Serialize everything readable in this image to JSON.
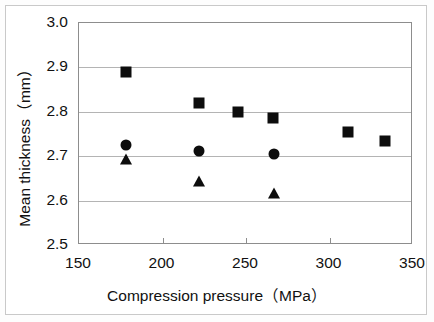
{
  "chart_data": {
    "type": "scatter",
    "title": "",
    "xlabel": "Compression pressure（MPa）",
    "ylabel": "Mean thickness（mm）",
    "xlim": [
      150,
      350
    ],
    "ylim": [
      2.5,
      3.0
    ],
    "xticks": [
      150,
      200,
      250,
      300,
      350
    ],
    "yticks": [
      2.5,
      2.6,
      2.7,
      2.8,
      2.9,
      3.0
    ],
    "xtick_labels": [
      "150",
      "200",
      "250",
      "300",
      "350"
    ],
    "ytick_labels": [
      "2.5",
      "2.6",
      "2.7",
      "2.8",
      "2.9",
      "3.0"
    ],
    "grid": "horizontal",
    "legend": "none",
    "series": [
      {
        "name": "square-series",
        "marker": "square",
        "color": "#0d0d0d",
        "points": [
          {
            "x": 178,
            "y": 2.89
          },
          {
            "x": 222,
            "y": 2.82
          },
          {
            "x": 245,
            "y": 2.8
          },
          {
            "x": 266,
            "y": 2.785
          },
          {
            "x": 311,
            "y": 2.755
          },
          {
            "x": 333,
            "y": 2.735
          }
        ]
      },
      {
        "name": "circle-series",
        "marker": "circle",
        "color": "#0d0d0d",
        "points": [
          {
            "x": 178,
            "y": 2.725
          },
          {
            "x": 222,
            "y": 2.712
          },
          {
            "x": 267,
            "y": 2.705
          }
        ]
      },
      {
        "name": "triangle-series",
        "marker": "triangle",
        "color": "#0d0d0d",
        "points": [
          {
            "x": 178,
            "y": 2.693
          },
          {
            "x": 222,
            "y": 2.645
          },
          {
            "x": 267,
            "y": 2.618
          }
        ]
      }
    ]
  },
  "axis_titles": {
    "x": "Compression pressure（MPa）",
    "y": "Mean thickness（mm）"
  }
}
